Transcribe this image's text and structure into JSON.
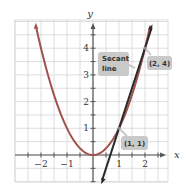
{
  "chart_data": {
    "type": "line",
    "title": "",
    "xlabel": "x",
    "ylabel": "y",
    "xlim": [
      -2.5,
      2.5
    ],
    "ylim": [
      -1,
      5
    ],
    "grid": true,
    "grid_step": 0.5,
    "x_ticks": [
      -2,
      -1,
      1,
      2
    ],
    "x_tick_labels": [
      "−2",
      "−1",
      "1",
      "2"
    ],
    "y_ticks": [
      1,
      2,
      3,
      4
    ],
    "y_tick_labels": [
      "1",
      "2",
      "3",
      "4"
    ],
    "series": [
      {
        "name": "y = x^2",
        "kind": "curve",
        "color": "#a0524d",
        "x": [
          -2.2,
          -2,
          -1.5,
          -1,
          -0.5,
          0,
          0.5,
          1,
          1.5,
          2,
          2.2
        ],
        "y": [
          4.84,
          4,
          2.25,
          1,
          0.25,
          0,
          0.25,
          1,
          2.25,
          4,
          4.84
        ]
      },
      {
        "name": "Secant line",
        "kind": "line",
        "color": "#2b2b2b",
        "equation": "y = 3x - 2",
        "x": [
          0.35,
          2.25
        ],
        "y": [
          -0.95,
          4.75
        ]
      }
    ],
    "annotations": [
      {
        "text": "(2, 4)",
        "point": [
          2,
          4
        ]
      },
      {
        "text": "(1, 1)",
        "point": [
          1,
          1
        ]
      },
      {
        "text_lines": [
          "Secant",
          "line"
        ],
        "target": "Secant line"
      }
    ],
    "colors": {
      "grid": "#d6d6d6",
      "axis": "#555555",
      "callout_bg": "#c9c9c9"
    }
  }
}
